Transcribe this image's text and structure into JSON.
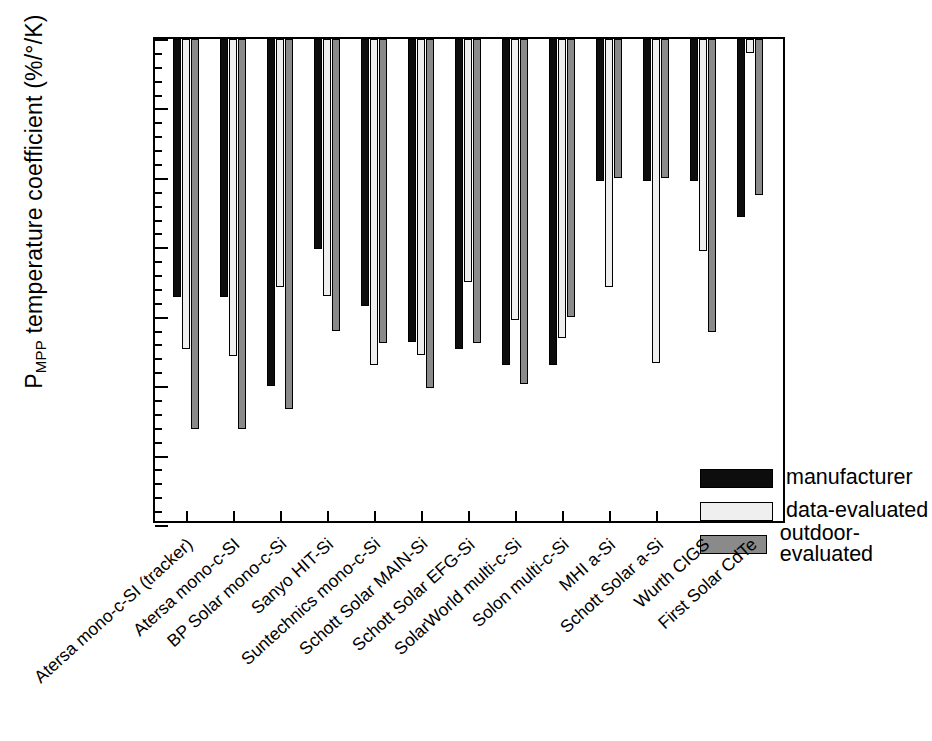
{
  "chart_data": {
    "type": "bar",
    "title": "",
    "xlabel": "",
    "ylabel": "P_MPP temperature coefficient (%/°/K)",
    "ylabel_main_pre": "P",
    "ylabel_sub": "MPP",
    "ylabel_main_post": " temperature coefficient (%/°/K)",
    "ylim": [
      -0.7,
      0.0
    ],
    "ytick_labels": [
      "0.0",
      "-0.1",
      "-0.2",
      "-0.3",
      "-0.4",
      "-0.5",
      "-0.6",
      "-0.7"
    ],
    "ytick_values": [
      0.0,
      -0.1,
      -0.2,
      -0.3,
      -0.4,
      -0.5,
      -0.6,
      -0.7
    ],
    "minor_tick_step": 0.02,
    "grid": false,
    "legend_position": "lower-right",
    "categories": [
      "Atersa mono-c-SI (tracker)",
      "Atersa mono-c-SI",
      "BP Solar mono-c-Si",
      "Sanyo HIT-Si",
      "Suntechnics mono-c-Si",
      "Schott Solar MAIN-Si",
      "Schott Solar EFG-Si",
      "SolarWorld multi-c-Si",
      "Solon multi-c-Si",
      "MHI a-Si",
      "Schott Solar a-Si",
      "Wurth CIGS",
      "First Solar CdTe"
    ],
    "series": [
      {
        "name": "manufacturer",
        "color": "#0d0d0d",
        "values": [
          -0.372,
          -0.372,
          -0.5,
          -0.303,
          -0.385,
          -0.437,
          -0.447,
          -0.47,
          -0.47,
          -0.205,
          -0.205,
          -0.205,
          -0.257
        ]
      },
      {
        "name": "data-evaluated",
        "color": "#efefef",
        "values": [
          -0.446,
          -0.456,
          -0.357,
          -0.37,
          -0.47,
          -0.455,
          -0.35,
          -0.405,
          -0.43,
          -0.357,
          -0.467,
          -0.305,
          -0.02
        ]
      },
      {
        "name": "outdoor-evaluated",
        "color": "#8a8a8a",
        "values": [
          -0.562,
          -0.562,
          -0.533,
          -0.42,
          -0.438,
          -0.503,
          -0.438,
          -0.497,
          -0.4,
          -0.2,
          -0.2,
          -0.422,
          -0.225
        ]
      }
    ]
  },
  "legend": {
    "items": [
      {
        "label": "manufacturer",
        "series": 0
      },
      {
        "label": "data-evaluated",
        "series": 1
      },
      {
        "label": "outdoor-evaluated",
        "series": 2
      }
    ]
  }
}
